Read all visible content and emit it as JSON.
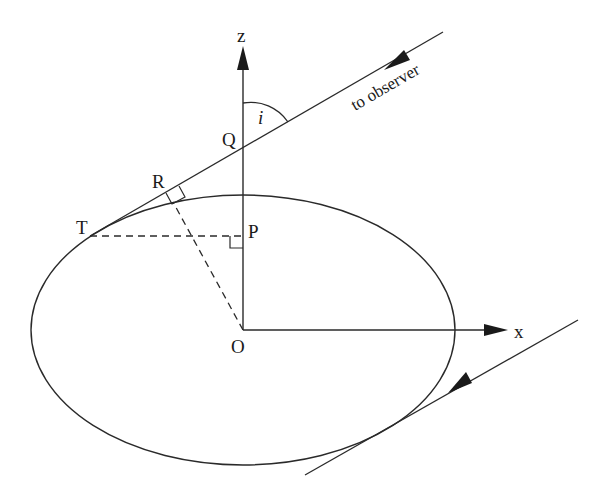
{
  "diagram": {
    "stroke_color": "#2a2a2a",
    "background": "#ffffff",
    "labels": {
      "z_axis": "z",
      "x_axis": "x",
      "point_Q": "Q",
      "point_P": "P",
      "point_O": "O",
      "point_R": "R",
      "point_T": "T",
      "angle_i": "i",
      "observer_direction": "to observer"
    }
  }
}
